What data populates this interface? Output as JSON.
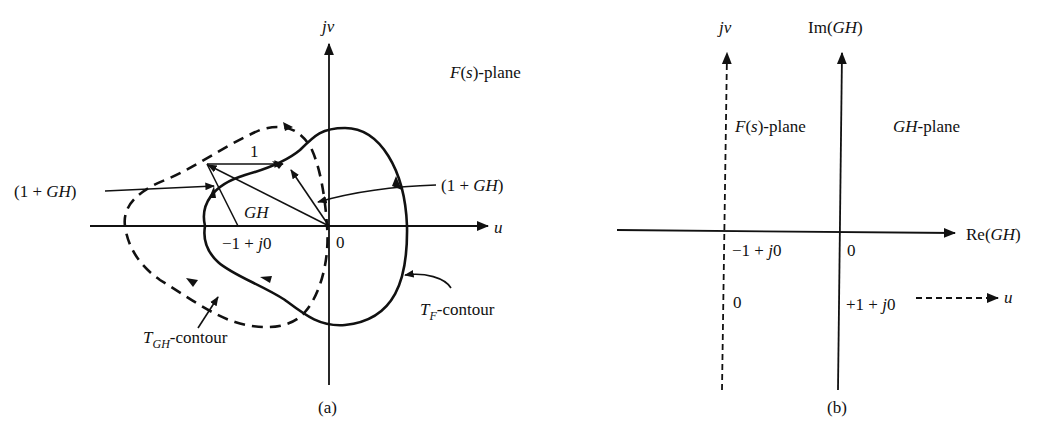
{
  "panel_a": {
    "caption": "(a)",
    "plane_label_fn": "F",
    "plane_label_arg": "s",
    "plane_label_rest": "-plane",
    "vertical_axis_label": "jv",
    "horizontal_axis_label": "u",
    "origin_label": "0",
    "critical_point_label": "−1 + j0",
    "critical_point_parts": {
      "prefix": "−1 + ",
      "j": "j",
      "suffix": "0"
    },
    "vector_labels": {
      "unit": "1",
      "gh": "GH",
      "one_plus_gh_left": {
        "prefix": "(1 + ",
        "italic": "GH",
        "suffix": ")"
      },
      "one_plus_gh_right": {
        "prefix": "(1 + ",
        "italic": "GH",
        "suffix": ")"
      }
    },
    "contours": {
      "tf": {
        "main": "T",
        "sub": "F",
        "rest": "-contour",
        "style": "solid"
      },
      "tgh": {
        "main": "T",
        "sub": "GH",
        "rest": "-contour",
        "style": "dashed"
      }
    }
  },
  "panel_b": {
    "caption": "(b)",
    "imag_axis_label": {
      "prefix": "Im(",
      "italic": "GH",
      "suffix": ")"
    },
    "real_axis_label": {
      "prefix": "Re(",
      "italic": "GH",
      "suffix": ")"
    },
    "jv_label": "jv",
    "u_label": "u",
    "fs_plane_label": {
      "fn": "F",
      "arg": "s",
      "rest": "-plane"
    },
    "gh_plane_label": {
      "italic": "GH",
      "rest": "-plane"
    },
    "minus_one_label": {
      "prefix": "−1 + ",
      "j": "j",
      "suffix": "0"
    },
    "origin_gh_label": "0",
    "origin_f_label": "0",
    "plus_one_label": {
      "prefix": "+1 + ",
      "j": "j",
      "suffix": "0"
    }
  }
}
